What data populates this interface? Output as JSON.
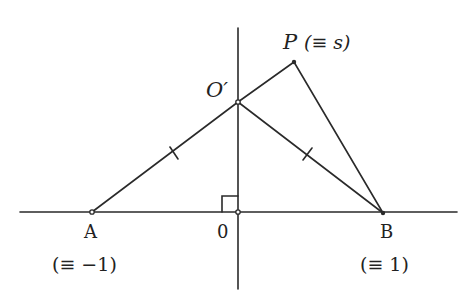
{
  "diagram": {
    "colors": {
      "stroke": "#2a2a2a",
      "text": "#222222",
      "background": "#ffffff"
    },
    "axes": {
      "horizontal": {
        "x1": 20,
        "x2": 457,
        "y": 212
      },
      "vertical": {
        "x": 238,
        "y1": 28,
        "y2": 289
      }
    },
    "points": {
      "A": {
        "x": 92,
        "y": 212,
        "label": "A",
        "sublabel": "(≡ −1)"
      },
      "O": {
        "x": 238,
        "y": 212,
        "label": "0"
      },
      "B": {
        "x": 383,
        "y": 213,
        "label": "B",
        "sublabel": "(≡ 1)"
      },
      "Oprime": {
        "x": 238,
        "y": 102,
        "label": "O′"
      },
      "P": {
        "x": 294,
        "y": 62,
        "label": "P",
        "sublabel": "(≡ s)"
      }
    },
    "segments": [
      {
        "from": "A",
        "to": "Oprime",
        "tick": true
      },
      {
        "from": "Oprime",
        "to": "B",
        "tick": true
      },
      {
        "from": "Oprime",
        "to": "P",
        "tick": false
      },
      {
        "from": "P",
        "to": "B",
        "tick": false
      }
    ],
    "right_angle_marker": {
      "x": 222,
      "y": 196,
      "size": 16
    }
  }
}
